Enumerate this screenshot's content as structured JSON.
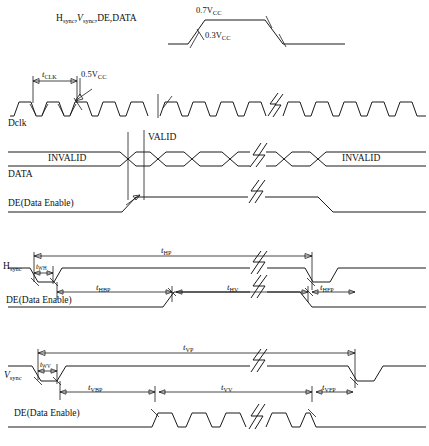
{
  "diagram": {
    "type": "timing-diagram"
  },
  "section_levels": {
    "signal_label": "H",
    "signal_label_sub1": "sync",
    "signal_label_mid": ",V",
    "signal_label_sub2": "sync",
    "signal_label_tail": ",DE,DATA",
    "full_label": "Hsync,Vsync,DE,DATA",
    "v_high": "0.7V",
    "v_high_sub": "CC",
    "v_low": "0.3V",
    "v_low_sub": "CC"
  },
  "clock_section": {
    "signal_name": "Dclk",
    "period_label": "t",
    "period_sub": "CLK",
    "threshold": "0.5V",
    "threshold_sub": "CC"
  },
  "data_section": {
    "data_label": "DATA",
    "de_label": "DE(Data Enable)",
    "invalid_left": "INVALID",
    "valid": "VALID",
    "invalid_right": "INVALID"
  },
  "hsync_section": {
    "signal_name": "H",
    "signal_sub": "sync",
    "de_label": "DE(Data Enable)",
    "t_period": "t",
    "t_period_sub": "HP",
    "t_pulse": "t",
    "t_pulse_sub": "WH",
    "t_back_porch": "t",
    "t_back_porch_sub": "HBP",
    "t_valid": "t",
    "t_valid_sub": "HV",
    "t_front_porch": "t",
    "t_front_porch_sub": "HFP"
  },
  "vsync_section": {
    "signal_name": "V",
    "signal_sub": "sync",
    "de_label": "DE(Data Enable)",
    "t_period": "t",
    "t_period_sub": "VP",
    "t_pulse": "t",
    "t_pulse_sub": "WV",
    "t_back_porch": "t",
    "t_back_porch_sub": "VBP",
    "t_valid": "t",
    "t_valid_sub": "VV",
    "t_front_porch": "t",
    "t_front_porch_sub": "VFP"
  },
  "colors": {
    "stroke": "#1a1a1a",
    "background": "#ffffff",
    "text": "#111111"
  }
}
